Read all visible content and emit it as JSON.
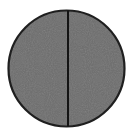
{
  "figure": {
    "name": "bisected-filled-circle",
    "background_color": "#ffffff",
    "canvas": {
      "width": 135,
      "height": 134
    },
    "shapes": {
      "circle": {
        "name": "circle-shape",
        "center_x": 66.5,
        "center_y": 68.5,
        "radius": 59,
        "fill_color": "#6d6d6d",
        "stroke_color": "#1f1f1f",
        "stroke_width": 2,
        "texture": "fine-grain-noise"
      },
      "divider": {
        "name": "vertical-divider-line",
        "orientation": "vertical",
        "x": 68,
        "y_start": 9.5,
        "y_end": 127.5,
        "stroke_color": "#141414",
        "stroke_width": 2
      }
    },
    "labels": {
      "title": "",
      "caption": "",
      "left_half": "",
      "right_half": ""
    }
  }
}
